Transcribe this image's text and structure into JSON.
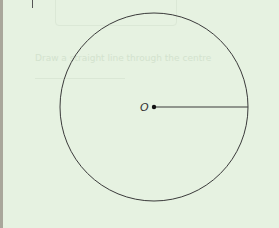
{
  "diagram": {
    "type": "circle-with-radius",
    "center_label": "O",
    "elements": [
      "circle",
      "center-point",
      "radius-segment"
    ],
    "colors": {
      "background": "#e6f2e1",
      "stroke": "#333333",
      "edge_bar": "#a9a79b"
    }
  },
  "bleed_through": {
    "faint_text": "Draw a straight line through the centre"
  }
}
